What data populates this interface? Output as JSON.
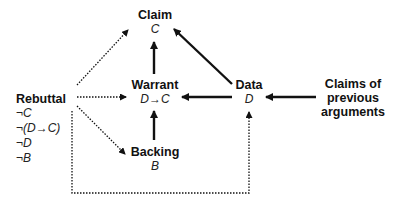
{
  "diagram": {
    "nodes": {
      "claim": {
        "title": "Claim",
        "symbol": "C"
      },
      "warrant": {
        "title": "Warrant",
        "symbol": "D→C"
      },
      "data": {
        "title": "Data",
        "symbol": "D"
      },
      "backing": {
        "title": "Backing",
        "symbol": "B"
      },
      "rebuttal": {
        "title": "Rebuttal",
        "items": [
          "¬C",
          "¬(D→C)",
          "¬D",
          "¬B"
        ]
      },
      "previous": {
        "title_line1": "Claims of",
        "title_line2": "previous",
        "title_line3": "arguments"
      }
    },
    "edges": [
      {
        "from": "warrant",
        "to": "claim",
        "style": "solid"
      },
      {
        "from": "data",
        "to": "claim",
        "style": "solid"
      },
      {
        "from": "data",
        "to": "warrant",
        "style": "solid"
      },
      {
        "from": "backing",
        "to": "warrant",
        "style": "solid"
      },
      {
        "from": "previous",
        "to": "data",
        "style": "solid"
      },
      {
        "from": "rebuttal",
        "to": "claim",
        "style": "dotted"
      },
      {
        "from": "rebuttal",
        "to": "warrant",
        "style": "dotted"
      },
      {
        "from": "rebuttal",
        "to": "backing",
        "style": "dotted"
      },
      {
        "from": "rebuttal",
        "to": "data",
        "style": "dotted"
      }
    ]
  }
}
